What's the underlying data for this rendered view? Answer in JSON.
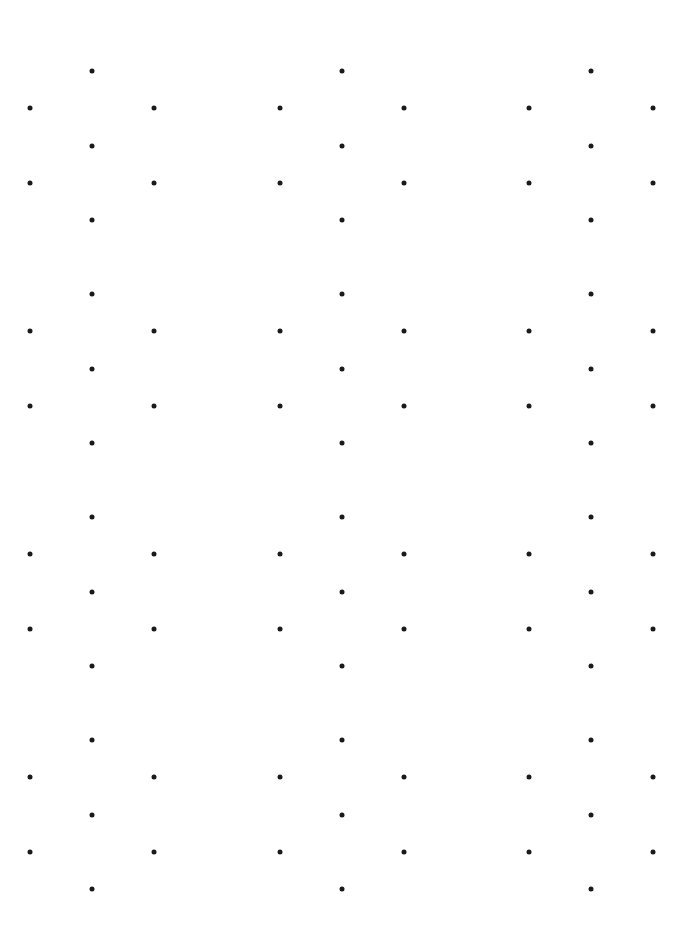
{
  "page": {
    "type": "hexagonal-dot-grid",
    "background": "#ffffff",
    "dot_color": "#1a1a1a",
    "dot_diameter": 5
  },
  "grid": {
    "columns_x": [
      92,
      342,
      591
    ],
    "rows_top_y": [
      71,
      294,
      517,
      740
    ],
    "hex_offsets": [
      {
        "name": "top",
        "dx": 0,
        "dy": 0
      },
      {
        "name": "upper-left",
        "dx": -62,
        "dy": 37
      },
      {
        "name": "upper-right",
        "dx": 62,
        "dy": 37
      },
      {
        "name": "center",
        "dx": 0,
        "dy": 75
      },
      {
        "name": "lower-left",
        "dx": -62,
        "dy": 112
      },
      {
        "name": "lower-right",
        "dx": 62,
        "dy": 112
      },
      {
        "name": "bottom",
        "dx": 0,
        "dy": 149
      }
    ]
  }
}
